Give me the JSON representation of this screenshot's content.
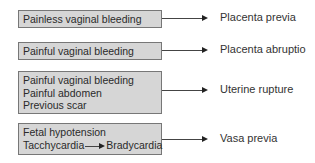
{
  "diagram": {
    "rows": [
      {
        "causes": [
          "Painless vaginal bleeding"
        ],
        "result": "Placenta previa"
      },
      {
        "causes": [
          "Painful vaginal bleeding"
        ],
        "result": "Placenta abruptio"
      },
      {
        "causes": [
          "Painful vaginal bleeding",
          "Painful abdomen",
          "Previous scar"
        ],
        "result": "Uterine rupture"
      },
      {
        "causes": [
          "Fetal hypotension"
        ],
        "transition": {
          "from": "Tacchycardia",
          "to": "Bradycardia"
        },
        "result": "Vasa previa"
      }
    ]
  }
}
